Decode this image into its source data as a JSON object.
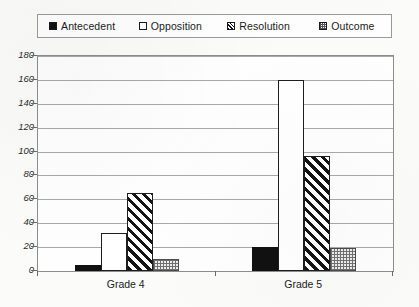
{
  "chart_data": {
    "type": "bar",
    "title": "",
    "subtitle": "",
    "xlabel": "",
    "ylabel": "",
    "categories": [
      "Grade 4",
      "Grade 5"
    ],
    "series": [
      {
        "name": "Antecedent",
        "values": [
          5,
          20
        ],
        "pattern": "solid-black"
      },
      {
        "name": "Opposition",
        "values": [
          32,
          160
        ],
        "pattern": "white-outline"
      },
      {
        "name": "Resolution",
        "values": [
          65,
          96
        ],
        "pattern": "diagonal-hatch"
      },
      {
        "name": "Outcome",
        "values": [
          10,
          19
        ],
        "pattern": "grey-crosshatch"
      }
    ],
    "ylim": [
      0,
      180
    ],
    "ytick_step": 20,
    "yticks": [
      0,
      20,
      40,
      60,
      80,
      100,
      120,
      140,
      160,
      180
    ],
    "ytick_labels": [
      "0",
      "20",
      "40",
      "60",
      "80",
      "100",
      "120",
      "140",
      "160",
      "180"
    ],
    "grid": true,
    "grid_axis": "y",
    "legend_position": "top",
    "colors": {
      "antecedent": "#111111",
      "opposition": "#ffffff",
      "resolution": "#141414",
      "outcome": "#6f6f6f",
      "grid": "#a8a8a8",
      "axis": "#8d8d8d",
      "text": "#1b1b1b"
    }
  },
  "legend": {
    "items": [
      {
        "label": "Antecedent",
        "swatch": "legend-swatch-solid-icon"
      },
      {
        "label": "Opposition",
        "swatch": "legend-swatch-white-icon"
      },
      {
        "label": "Resolution",
        "swatch": "legend-swatch-hatch-icon"
      },
      {
        "label": "Outcome",
        "swatch": "legend-swatch-crosshatch-icon"
      }
    ]
  },
  "axes": {
    "y_labels": [
      "180",
      "160",
      "140",
      "120",
      "100",
      "80",
      "60",
      "40",
      "20",
      "0"
    ],
    "x_labels": [
      "Grade 4",
      "Grade 5"
    ]
  }
}
